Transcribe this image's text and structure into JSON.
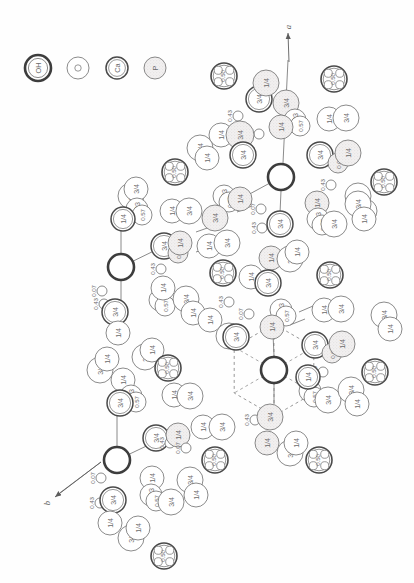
{
  "figure": {
    "background": "#fefefe",
    "ink": "#6d6d6d",
    "ink_strong": "#4a4a4a",
    "stipple": "#eceaea"
  },
  "legend": {
    "items": [
      {
        "label": "OH",
        "kind": "oh",
        "cx": 38,
        "cy": 68,
        "r": 13
      },
      {
        "label": "O",
        "kind": "o",
        "cx": 78,
        "cy": 68,
        "r": 11
      },
      {
        "label": "Ca",
        "kind": "ca",
        "cx": 117,
        "cy": 68,
        "r": 11
      },
      {
        "label": "P",
        "kind": "p",
        "cx": 155,
        "cy": 68,
        "r": 11
      }
    ]
  },
  "axes": [
    {
      "name": "a",
      "label": "a",
      "x1": 289,
      "y1": 62,
      "x2": 288,
      "y2": 33,
      "lx": 288,
      "ly": 27
    },
    {
      "name": "b",
      "label": "b",
      "x1": 101,
      "y1": 462,
      "x2": 55,
      "y2": 497,
      "lx": 47,
      "ly": 503
    }
  ],
  "po4_groups": [
    {
      "label": "0.50",
      "cx": 224,
      "cy": 76,
      "r": 13
    },
    {
      "label": "0.50",
      "cx": 334,
      "cy": 79,
      "r": 13
    },
    {
      "label": "0.50",
      "cx": 175,
      "cy": 172,
      "r": 13
    },
    {
      "label": "0.50",
      "cx": 384,
      "cy": 182,
      "r": 13
    },
    {
      "label": "0.50",
      "cx": 223,
      "cy": 273,
      "r": 13
    },
    {
      "label": "0.50",
      "cx": 330,
      "cy": 275,
      "r": 13
    },
    {
      "label": "0.50",
      "cx": 168,
      "cy": 368,
      "r": 13
    },
    {
      "label": "0.50",
      "cx": 375,
      "cy": 372,
      "r": 13
    },
    {
      "label": "0.50",
      "cx": 215,
      "cy": 460,
      "r": 13
    },
    {
      "label": "0.50",
      "cx": 319,
      "cy": 460,
      "r": 13
    },
    {
      "label": "0.50",
      "cx": 164,
      "cy": 556,
      "r": 13
    }
  ],
  "oh_sites": [
    {
      "cx": 281,
      "cy": 177,
      "r": 13
    },
    {
      "cx": 121,
      "cy": 267,
      "r": 13
    },
    {
      "cx": 274,
      "cy": 370,
      "r": 13
    },
    {
      "cx": 117,
      "cy": 460,
      "r": 13
    }
  ],
  "bonds": [
    {
      "x1": 288,
      "y1": 60,
      "x2": 283,
      "y2": 163
    },
    {
      "x1": 281,
      "y1": 191,
      "x2": 280,
      "y2": 213
    },
    {
      "x1": 281,
      "y1": 177,
      "x2": 246,
      "y2": 196
    },
    {
      "x1": 121,
      "y1": 253,
      "x2": 121,
      "y2": 225
    },
    {
      "x1": 121,
      "y1": 267,
      "x2": 160,
      "y2": 248
    },
    {
      "x1": 121,
      "y1": 281,
      "x2": 121,
      "y2": 345
    },
    {
      "x1": 274,
      "y1": 356,
      "x2": 273,
      "y2": 334
    },
    {
      "x1": 274,
      "y1": 384,
      "x2": 274,
      "y2": 404
    },
    {
      "x1": 117,
      "y1": 446,
      "x2": 117,
      "y2": 378
    },
    {
      "x1": 117,
      "y1": 460,
      "x2": 157,
      "y2": 441
    },
    {
      "x1": 101,
      "y1": 462,
      "x2": 57,
      "y2": 495
    },
    {
      "x1": 196,
      "y1": 232,
      "x2": 213,
      "y2": 226
    },
    {
      "x1": 206,
      "y1": 245,
      "x2": 226,
      "y2": 238
    },
    {
      "x1": 196,
      "y1": 252,
      "x2": 214,
      "y2": 246
    },
    {
      "x1": 237,
      "y1": 212,
      "x2": 252,
      "y2": 206
    },
    {
      "x1": 299,
      "y1": 312,
      "x2": 313,
      "y2": 306
    },
    {
      "x1": 290,
      "y1": 325,
      "x2": 305,
      "y2": 319
    }
  ],
  "hex_ring": {
    "cx": 274,
    "cy": 370,
    "r": 46,
    "note": "dashed hexagonal cage around lower OH column"
  },
  "atoms": [
    {
      "l": "3/4",
      "cx": 259,
      "cy": 99,
      "r": 13,
      "k": "ca"
    },
    {
      "l": "1/4",
      "cx": 266,
      "cy": 83,
      "r": 13,
      "k": "p"
    },
    {
      "l": "3/4",
      "cx": 286,
      "cy": 103,
      "r": 13,
      "k": "p"
    },
    {
      "l": "0.93",
      "cx": 295,
      "cy": 120,
      "r": 11,
      "k": "o"
    },
    {
      "l": "0.57",
      "cx": 300,
      "cy": 126,
      "r": 10,
      "k": "o"
    },
    {
      "l": "1/4",
      "cx": 281,
      "cy": 127,
      "r": 12,
      "k": "p"
    },
    {
      "l": "0.43",
      "cx": 238,
      "cy": 116,
      "r": 5,
      "k": "o"
    },
    {
      "l": "0.07",
      "cx": 259,
      "cy": 134,
      "r": 5,
      "k": "o"
    },
    {
      "l": "1/4",
      "cx": 221,
      "cy": 135,
      "r": 12,
      "k": "o"
    },
    {
      "l": "3/4",
      "cx": 240,
      "cy": 135,
      "r": 14,
      "k": "p"
    },
    {
      "l": "3/4",
      "cx": 200,
      "cy": 148,
      "r": 13,
      "k": "o"
    },
    {
      "l": "1/4",
      "cx": 207,
      "cy": 158,
      "r": 12,
      "k": "o"
    },
    {
      "l": "3/4",
      "cx": 243,
      "cy": 155,
      "r": 13,
      "k": "ca"
    },
    {
      "l": "1/4",
      "cx": 329,
      "cy": 119,
      "r": 12,
      "k": "o"
    },
    {
      "l": "3/4",
      "cx": 346,
      "cy": 118,
      "r": 13,
      "k": "o"
    },
    {
      "l": "3/4",
      "cx": 320,
      "cy": 155,
      "r": 13,
      "k": "ca"
    },
    {
      "l": "0.07",
      "cx": 338,
      "cy": 163,
      "r": 10,
      "k": "p"
    },
    {
      "l": "1/4",
      "cx": 348,
      "cy": 153,
      "r": 13,
      "k": "p"
    },
    {
      "l": "0.43",
      "cx": 331,
      "cy": 185,
      "r": 5,
      "k": "o"
    },
    {
      "l": "3/4",
      "cx": 358,
      "cy": 196,
      "r": 13,
      "k": "o"
    },
    {
      "l": "1/4",
      "cx": 365,
      "cy": 211,
      "r": 12,
      "k": "o"
    },
    {
      "l": "3/4",
      "cx": 131,
      "cy": 196,
      "r": 13,
      "k": "o"
    },
    {
      "l": "3/4",
      "cx": 136,
      "cy": 189,
      "r": 12,
      "k": "o"
    },
    {
      "l": "0.93",
      "cx": 137,
      "cy": 209,
      "r": 11,
      "k": "o"
    },
    {
      "l": "0.57",
      "cx": 142,
      "cy": 215,
      "r": 10,
      "k": "o"
    },
    {
      "l": "1/4",
      "cx": 123,
      "cy": 219,
      "r": 12,
      "k": "ca"
    },
    {
      "l": "0.93",
      "cx": 224,
      "cy": 196,
      "r": 11,
      "k": "o"
    },
    {
      "l": "0.57",
      "cx": 229,
      "cy": 202,
      "r": 10,
      "k": "o"
    },
    {
      "l": "1/4",
      "cx": 240,
      "cy": 199,
      "r": 12,
      "k": "p"
    },
    {
      "l": "1/4",
      "cx": 172,
      "cy": 211,
      "r": 12,
      "k": "o"
    },
    {
      "l": "3/4",
      "cx": 189,
      "cy": 211,
      "r": 13,
      "k": "o"
    },
    {
      "l": "3/4",
      "cx": 215,
      "cy": 218,
      "r": 13,
      "k": "p"
    },
    {
      "l": "0.07",
      "cx": 261,
      "cy": 209,
      "r": 5,
      "k": "o"
    },
    {
      "l": "0.43",
      "cx": 262,
      "cy": 228,
      "r": 5,
      "k": "o"
    },
    {
      "l": "3/4",
      "cx": 280,
      "cy": 224,
      "r": 13,
      "k": "ca"
    },
    {
      "l": "1/4",
      "cx": 317,
      "cy": 203,
      "r": 12,
      "k": "p"
    },
    {
      "l": "0.93",
      "cx": 318,
      "cy": 219,
      "r": 11,
      "k": "o"
    },
    {
      "l": "0.57",
      "cx": 322,
      "cy": 225,
      "r": 10,
      "k": "o"
    },
    {
      "l": "3/4",
      "cx": 334,
      "cy": 224,
      "r": 13,
      "k": "o"
    },
    {
      "l": "3/4",
      "cx": 358,
      "cy": 204,
      "r": 13,
      "k": "o"
    },
    {
      "l": "1/4",
      "cx": 364,
      "cy": 219,
      "r": 12,
      "k": "o"
    },
    {
      "l": "3/4",
      "cx": 164,
      "cy": 246,
      "r": 13,
      "k": "ca"
    },
    {
      "l": "0.07",
      "cx": 178,
      "cy": 253,
      "r": 10,
      "k": "p"
    },
    {
      "l": "1/4",
      "cx": 180,
      "cy": 243,
      "r": 12,
      "k": "p"
    },
    {
      "l": "1/4",
      "cx": 209,
      "cy": 246,
      "r": 12,
      "k": "o"
    },
    {
      "l": "3/4",
      "cx": 227,
      "cy": 243,
      "r": 13,
      "k": "o"
    },
    {
      "l": "0.43",
      "cx": 161,
      "cy": 269,
      "r": 5,
      "k": "o"
    },
    {
      "l": "1/4",
      "cx": 271,
      "cy": 258,
      "r": 12,
      "k": "p"
    },
    {
      "l": "3/4",
      "cx": 290,
      "cy": 259,
      "r": 13,
      "k": "o"
    },
    {
      "l": "1/4",
      "cx": 297,
      "cy": 252,
      "r": 12,
      "k": "o"
    },
    {
      "l": "1/4",
      "cx": 251,
      "cy": 277,
      "r": 12,
      "k": "o"
    },
    {
      "l": "3/4",
      "cx": 268,
      "cy": 283,
      "r": 13,
      "k": "ca"
    },
    {
      "l": "0.43",
      "cx": 104,
      "cy": 304,
      "r": 5,
      "k": "o"
    },
    {
      "l": "0.07",
      "cx": 102,
      "cy": 291,
      "r": 5,
      "k": "o"
    },
    {
      "l": "3/4",
      "cx": 115,
      "cy": 312,
      "r": 13,
      "k": "ca"
    },
    {
      "l": "1/4",
      "cx": 118,
      "cy": 333,
      "r": 12,
      "k": "o"
    },
    {
      "l": "0.93",
      "cx": 160,
      "cy": 300,
      "r": 11,
      "k": "o"
    },
    {
      "l": "0.57",
      "cx": 165,
      "cy": 306,
      "r": 10,
      "k": "o"
    },
    {
      "l": "1/4",
      "cx": 163,
      "cy": 288,
      "r": 12,
      "k": "o"
    },
    {
      "l": "3/4",
      "cx": 186,
      "cy": 299,
      "r": 13,
      "k": "o"
    },
    {
      "l": "1/4",
      "cx": 193,
      "cy": 313,
      "r": 12,
      "k": "o"
    },
    {
      "l": "0.43",
      "cx": 229,
      "cy": 302,
      "r": 5,
      "k": "o"
    },
    {
      "l": "0.07",
      "cx": 249,
      "cy": 314,
      "r": 5,
      "k": "o"
    },
    {
      "l": "1/4",
      "cx": 210,
      "cy": 320,
      "r": 12,
      "k": "o"
    },
    {
      "l": "3/4",
      "cx": 229,
      "cy": 336,
      "r": 13,
      "k": "o"
    },
    {
      "l": "0.93",
      "cx": 281,
      "cy": 310,
      "r": 11,
      "k": "o"
    },
    {
      "l": "0.57",
      "cx": 286,
      "cy": 316,
      "r": 10,
      "k": "o"
    },
    {
      "l": "1/4",
      "cx": 272,
      "cy": 327,
      "r": 12,
      "k": "p"
    },
    {
      "l": "3/4",
      "cx": 236,
      "cy": 337,
      "r": 13,
      "k": "ca"
    },
    {
      "l": "1/4",
      "cx": 324,
      "cy": 310,
      "r": 12,
      "k": "o"
    },
    {
      "l": "3/4",
      "cx": 341,
      "cy": 309,
      "r": 13,
      "k": "o"
    },
    {
      "l": "3/4",
      "cx": 315,
      "cy": 345,
      "r": 13,
      "k": "ca"
    },
    {
      "l": "0.07",
      "cx": 332,
      "cy": 353,
      "r": 10,
      "k": "p"
    },
    {
      "l": "1/4",
      "cx": 342,
      "cy": 344,
      "r": 13,
      "k": "p"
    },
    {
      "l": "0.43",
      "cx": 323,
      "cy": 372,
      "r": 5,
      "k": "o"
    },
    {
      "l": "3/4",
      "cx": 100,
      "cy": 370,
      "r": 13,
      "k": "o"
    },
    {
      "l": "1/4",
      "cx": 107,
      "cy": 359,
      "r": 12,
      "k": "o"
    },
    {
      "l": "3/4",
      "cx": 145,
      "cy": 357,
      "r": 13,
      "k": "o"
    },
    {
      "l": "1/4",
      "cx": 152,
      "cy": 350,
      "r": 12,
      "k": "o"
    },
    {
      "l": "1/4",
      "cx": 123,
      "cy": 380,
      "r": 12,
      "k": "o"
    },
    {
      "l": "0.93",
      "cx": 131,
      "cy": 396,
      "r": 11,
      "k": "o"
    },
    {
      "l": "0.57",
      "cx": 136,
      "cy": 402,
      "r": 10,
      "k": "o"
    },
    {
      "l": "3/4",
      "cx": 120,
      "cy": 403,
      "r": 13,
      "k": "ca"
    },
    {
      "l": "1/4",
      "cx": 174,
      "cy": 395,
      "r": 12,
      "k": "o"
    },
    {
      "l": "3/4",
      "cx": 190,
      "cy": 396,
      "r": 13,
      "k": "o"
    },
    {
      "l": "0.93",
      "cx": 310,
      "cy": 391,
      "r": 11,
      "k": "o"
    },
    {
      "l": "0.57",
      "cx": 314,
      "cy": 397,
      "r": 10,
      "k": "o"
    },
    {
      "l": "1/4",
      "cx": 308,
      "cy": 377,
      "r": 12,
      "k": "ca"
    },
    {
      "l": "3/4",
      "cx": 328,
      "cy": 400,
      "r": 13,
      "k": "o"
    },
    {
      "l": "3/4",
      "cx": 351,
      "cy": 390,
      "r": 13,
      "k": "o"
    },
    {
      "l": "1/4",
      "cx": 357,
      "cy": 404,
      "r": 12,
      "k": "o"
    },
    {
      "l": "0.43",
      "cx": 255,
      "cy": 420,
      "r": 5,
      "k": "o"
    },
    {
      "l": "3/4",
      "cx": 270,
      "cy": 417,
      "r": 13,
      "k": "p"
    },
    {
      "l": "1/4",
      "cx": 203,
      "cy": 427,
      "r": 12,
      "k": "o"
    },
    {
      "l": "3/4",
      "cx": 222,
      "cy": 427,
      "r": 13,
      "k": "o"
    },
    {
      "l": "1/4",
      "cx": 267,
      "cy": 443,
      "r": 12,
      "k": "p"
    },
    {
      "l": "3/4",
      "cx": 290,
      "cy": 453,
      "r": 13,
      "k": "o"
    },
    {
      "l": "1/4",
      "cx": 296,
      "cy": 443,
      "r": 12,
      "k": "o"
    },
    {
      "l": "3/4",
      "cx": 156,
      "cy": 438,
      "r": 13,
      "k": "ca"
    },
    {
      "l": "0.43",
      "cx": 170,
      "cy": 443,
      "r": 5,
      "k": "o"
    },
    {
      "l": "1/4",
      "cx": 178,
      "cy": 435,
      "r": 12,
      "k": "p"
    },
    {
      "l": "0.07",
      "cx": 186,
      "cy": 448,
      "r": 5,
      "k": "o"
    },
    {
      "l": "0.07",
      "cx": 101,
      "cy": 478,
      "r": 5,
      "k": "o"
    },
    {
      "l": "0.43",
      "cx": 100,
      "cy": 503,
      "r": 5,
      "k": "o"
    },
    {
      "l": "3/4",
      "cx": 113,
      "cy": 500,
      "r": 13,
      "k": "ca"
    },
    {
      "l": "1/4",
      "cx": 110,
      "cy": 523,
      "r": 12,
      "k": "o"
    },
    {
      "l": "3/4",
      "cx": 131,
      "cy": 538,
      "r": 13,
      "k": "o"
    },
    {
      "l": "1/4",
      "cx": 138,
      "cy": 528,
      "r": 12,
      "k": "o"
    },
    {
      "l": "1/4",
      "cx": 152,
      "cy": 478,
      "r": 12,
      "k": "o"
    },
    {
      "l": "0.93",
      "cx": 151,
      "cy": 495,
      "r": 11,
      "k": "o"
    },
    {
      "l": "0.57",
      "cx": 156,
      "cy": 501,
      "r": 10,
      "k": "o"
    },
    {
      "l": "3/4",
      "cx": 171,
      "cy": 502,
      "r": 13,
      "k": "o"
    },
    {
      "l": "3/4",
      "cx": 190,
      "cy": 480,
      "r": 13,
      "k": "o"
    },
    {
      "l": "1/4",
      "cx": 196,
      "cy": 495,
      "r": 12,
      "k": "o"
    },
    {
      "l": "3/4",
      "cx": 384,
      "cy": 315,
      "r": 13,
      "k": "o"
    },
    {
      "l": "1/4",
      "cx": 390,
      "cy": 329,
      "r": 12,
      "k": "o"
    }
  ]
}
